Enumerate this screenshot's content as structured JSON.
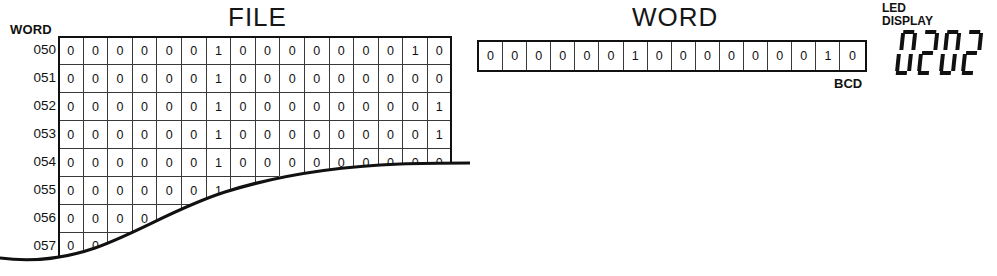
{
  "file_panel": {
    "title": "FILE",
    "word_caption": "WORD",
    "rows": [
      {
        "label": "050",
        "bits": [
          "0",
          "0",
          "0",
          "0",
          "0",
          "0",
          "1",
          "0",
          "0",
          "0",
          "0",
          "0",
          "0",
          "0",
          "1",
          "0"
        ],
        "visible_cells": 16
      },
      {
        "label": "051",
        "bits": [
          "0",
          "0",
          "0",
          "0",
          "0",
          "0",
          "1",
          "0",
          "0",
          "0",
          "0",
          "0",
          "0",
          "0",
          "0",
          "0"
        ],
        "visible_cells": 16
      },
      {
        "label": "052",
        "bits": [
          "0",
          "0",
          "0",
          "0",
          "0",
          "0",
          "1",
          "0",
          "0",
          "0",
          "0",
          "0",
          "0",
          "0",
          "0",
          "1"
        ],
        "visible_cells": 16
      },
      {
        "label": "053",
        "bits": [
          "0",
          "0",
          "0",
          "0",
          "0",
          "0",
          "1",
          "0",
          "0",
          "0",
          "0",
          "0",
          "0",
          "0",
          "0",
          "1"
        ],
        "visible_cells": 16
      },
      {
        "label": "054",
        "bits": [
          "0",
          "0",
          "0",
          "0",
          "0",
          "0",
          "1",
          "0",
          "0",
          "0",
          "0",
          "0",
          "0",
          "0",
          "0",
          "0"
        ],
        "visible_cells": 16
      },
      {
        "label": "055",
        "bits": [
          "0",
          "0",
          "0",
          "0",
          "0",
          "0",
          "1",
          "0",
          "0"
        ],
        "visible_cells": 9
      },
      {
        "label": "056",
        "bits": [
          "0",
          "0",
          "0",
          "0",
          "0",
          "0"
        ],
        "visible_cells": 6
      },
      {
        "label": "057",
        "bits": [
          "0",
          "0",
          "0",
          "0"
        ],
        "visible_cells": 4
      }
    ]
  },
  "word_panel": {
    "title": "WORD",
    "bits": [
      "0",
      "0",
      "0",
      "0",
      "0",
      "0",
      "1",
      "0",
      "0",
      "0",
      "0",
      "0",
      "0",
      "0",
      "1",
      "0"
    ],
    "format_label": "BCD"
  },
  "led_panel": {
    "caption_line1": "LED",
    "caption_line2": "DISPLAY",
    "value": "0202",
    "digits": [
      "0",
      "2",
      "0",
      "2"
    ]
  },
  "colors": {
    "ink": "#111111",
    "grid_line": "#3a3a3a",
    "background": "#ffffff"
  }
}
